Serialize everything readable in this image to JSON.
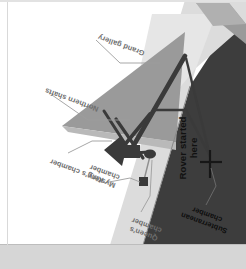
{
  "diagram": {
    "orientation": "rotated-180",
    "labels": {
      "grand_gallery": "Grand gallery",
      "northern_shafts": "Northern shafts",
      "kings_chamber": "King's chamber",
      "mystery_chamber_line1": "Mystery",
      "mystery_chamber_line2": "chamber",
      "queens_chamber_line1": "Queen's",
      "queens_chamber_line2": "chamber",
      "subterranean_chamber_line1": "Subterranean",
      "subterranean_chamber_line2": "chamber",
      "rover_start_line1": "Rover started",
      "rover_start_line2": "here"
    },
    "colors": {
      "page_background": "#ffffff",
      "frame_band": "#d6d6d6",
      "pyramid_light": "#dcdcdc",
      "pyramid_mid": "#9a9a9a",
      "pyramid_shadow": "#b4b4b4",
      "bedrock_dark": "#3d3d3d",
      "passage_stroke": "#3a3a3a",
      "leader_line": "#9d9d9d",
      "label_text": "#6e6e6e",
      "emphasis_text": "#111111"
    }
  }
}
